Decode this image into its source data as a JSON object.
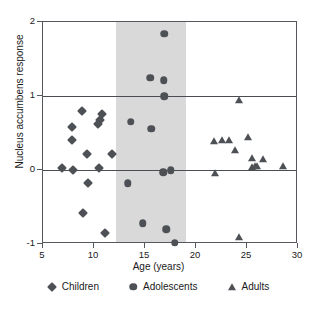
{
  "chart_data": {
    "type": "scatter",
    "title": "",
    "xlabel": "Age (years)",
    "ylabel": "Nucleus accumbens response",
    "xlim": [
      5,
      30
    ],
    "ylim": [
      -1,
      2
    ],
    "xticks": [
      5,
      10,
      15,
      20,
      25,
      30
    ],
    "yticks": [
      -1,
      0,
      1,
      2
    ],
    "grid": false,
    "gridlines_y": [
      0,
      1
    ],
    "legend_position": "bottom",
    "shaded_region": {
      "label": "adolescence",
      "x_start": 12.2,
      "x_end": 19.0,
      "color": "#d9d9d9"
    },
    "marker_color": "#4d5054",
    "series": [
      {
        "name": "Children",
        "marker": "diamond",
        "points": [
          [
            6.9,
            0.03
          ],
          [
            7.8,
            0.58
          ],
          [
            7.85,
            0.4
          ],
          [
            7.9,
            0.0
          ],
          [
            8.8,
            0.8
          ],
          [
            9.3,
            0.22
          ],
          [
            9.4,
            -0.18
          ],
          [
            8.95,
            -0.58
          ],
          [
            10.4,
            0.62
          ],
          [
            10.6,
            0.68
          ],
          [
            10.75,
            0.76
          ],
          [
            10.5,
            0.03
          ],
          [
            11.1,
            -0.85
          ],
          [
            11.8,
            0.21
          ]
        ]
      },
      {
        "name": "Adolescents",
        "marker": "circle",
        "points": [
          [
            13.3,
            -0.18
          ],
          [
            13.6,
            0.65
          ],
          [
            14.8,
            -0.72
          ],
          [
            15.5,
            1.25
          ],
          [
            15.6,
            0.56
          ],
          [
            16.9,
            1.84
          ],
          [
            16.85,
            1.21
          ],
          [
            16.9,
            1.0
          ],
          [
            16.8,
            -0.03
          ],
          [
            17.1,
            -0.8
          ],
          [
            17.5,
            0.0
          ],
          [
            17.9,
            -0.98
          ]
        ]
      },
      {
        "name": "Adults",
        "marker": "triangle",
        "points": [
          [
            21.8,
            0.39
          ],
          [
            21.9,
            -0.04
          ],
          [
            22.5,
            0.41
          ],
          [
            23.2,
            0.41
          ],
          [
            23.8,
            0.27
          ],
          [
            24.2,
            0.95
          ],
          [
            24.2,
            -0.9
          ],
          [
            25.1,
            0.45
          ],
          [
            25.5,
            0.16
          ],
          [
            25.5,
            0.04
          ],
          [
            25.8,
            0.05
          ],
          [
            26.0,
            0.05
          ],
          [
            26.6,
            0.15
          ],
          [
            28.5,
            0.06
          ]
        ]
      }
    ]
  },
  "legend": {
    "items": [
      {
        "label": "Children",
        "marker": "diamond"
      },
      {
        "label": "Adolescents",
        "marker": "circle"
      },
      {
        "label": "Adults",
        "marker": "triangle"
      }
    ]
  }
}
